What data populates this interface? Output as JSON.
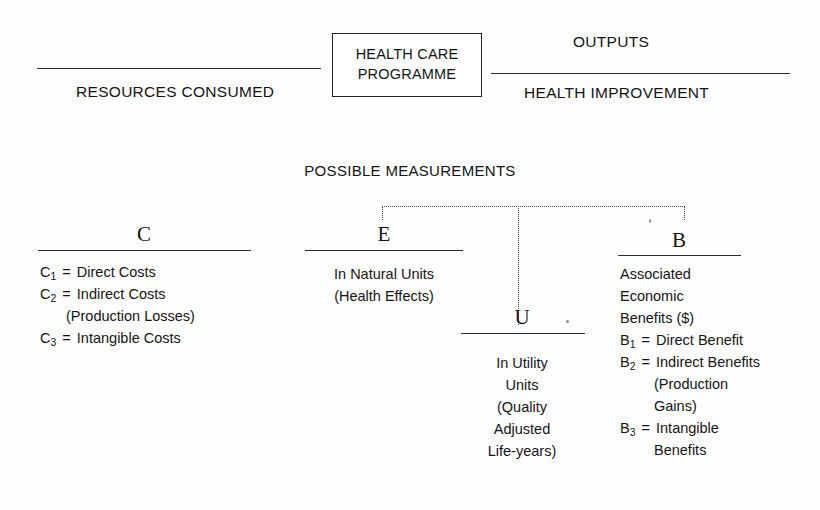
{
  "figure": {
    "top_band": {
      "left_label": "RESOURCES CONSUMED",
      "centre_box_line1": "HEALTH CARE",
      "centre_box_line2": "PROGRAMME",
      "right_label_top": "OUTPUTS",
      "right_label_bottom": "HEALTH IMPROVEMENT"
    },
    "measurements_title": "POSSIBLE MEASUREMENTS",
    "columns": [
      {
        "id": "costs",
        "letter": "C",
        "lines": [
          {
            "symbol": "C",
            "sub": "1",
            "eq": "=",
            "text": "Direct Costs",
            "indent": 0
          },
          {
            "symbol": "C",
            "sub": "2",
            "eq": "=",
            "text": "Indirect Costs",
            "indent": 0
          },
          {
            "symbol": "",
            "sub": "",
            "eq": "",
            "text": "(Production Losses)",
            "indent": 1
          },
          {
            "symbol": "C",
            "sub": "3",
            "eq": "=",
            "text": "Intangible Costs",
            "indent": 0
          }
        ]
      },
      {
        "id": "effects",
        "letter": "E",
        "lines": [
          {
            "symbol": "",
            "sub": "",
            "eq": "",
            "text": "In Natural Units",
            "indent": 0
          },
          {
            "symbol": "",
            "sub": "",
            "eq": "",
            "text": "(Health Effects)",
            "indent": 0
          }
        ]
      },
      {
        "id": "utility",
        "letter": "U",
        "lines": [
          {
            "symbol": "",
            "sub": "",
            "eq": "",
            "text": "In Utility",
            "indent": 0
          },
          {
            "symbol": "",
            "sub": "",
            "eq": "",
            "text": "Units",
            "indent": 0
          },
          {
            "symbol": "",
            "sub": "",
            "eq": "",
            "text": "(Quality",
            "indent": 0
          },
          {
            "symbol": "",
            "sub": "",
            "eq": "",
            "text": "Adjusted",
            "indent": 0
          },
          {
            "symbol": "",
            "sub": "",
            "eq": "",
            "text": "Life-years)",
            "indent": 0
          }
        ]
      },
      {
        "id": "benefits",
        "letter": "B",
        "lines": [
          {
            "symbol": "",
            "sub": "",
            "eq": "",
            "text": "Associated",
            "indent": 0
          },
          {
            "symbol": "",
            "sub": "",
            "eq": "",
            "text": "Economic",
            "indent": 0
          },
          {
            "symbol": "",
            "sub": "",
            "eq": "",
            "text": "Benefits  ($)",
            "indent": 0
          },
          {
            "symbol": "B",
            "sub": "1",
            "eq": "=",
            "text": "Direct Benefit",
            "indent": 0
          },
          {
            "symbol": "B",
            "sub": "2",
            "eq": "=",
            "text": "Indirect Benefits",
            "indent": 0
          },
          {
            "symbol": "",
            "sub": "",
            "eq": "",
            "text": "(Production",
            "indent": 2
          },
          {
            "symbol": "",
            "sub": "",
            "eq": "",
            "text": "Gains)",
            "indent": 2
          },
          {
            "symbol": "B",
            "sub": "3",
            "eq": "=",
            "text": "Intangible",
            "indent": 0
          },
          {
            "symbol": "",
            "sub": "",
            "eq": "",
            "text": "Benefits",
            "indent": 2
          }
        ]
      }
    ],
    "colors": {
      "ink": "#1a1a1a",
      "rule": "#2b2b2b",
      "dotted": "#4a4a4a",
      "paper": "#fefefe"
    }
  }
}
